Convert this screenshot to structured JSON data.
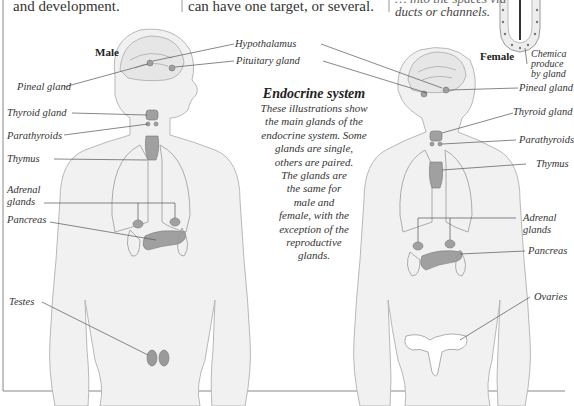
{
  "intro": {
    "col1_tail": "and development.",
    "col2_tail": "can have one target, or several.",
    "col3_tail_line1": "… into the spaces via",
    "col3_tail_line2": "ducts or channels.",
    "inset_caption": [
      "Chemica",
      "produce",
      "by gland"
    ]
  },
  "figures": {
    "male_label": "Male",
    "female_label": "Female"
  },
  "caption": {
    "title": "Endocrine system",
    "body_lines": [
      "These illustrations show",
      "the main glands of the",
      "endocrine system. Some",
      "glands are single,",
      "others are paired.",
      "The glands are",
      "the same for",
      "male and",
      "female, with the",
      "exception of the",
      "reproductive",
      "glands."
    ]
  },
  "male_labels": {
    "pineal": "Pineal gland",
    "thyroid": "Thyroid gland",
    "parathyroids": "Parathyroids",
    "thymus": "Thymus",
    "adrenal_1": "Adrenal",
    "adrenal_2": "glands",
    "pancreas": "Pancreas",
    "testes": "Testes"
  },
  "shared_labels": {
    "hypothalamus": "Hypothalamus",
    "pituitary": "Pituitary gland"
  },
  "female_labels": {
    "pineal": "Pineal gland",
    "thyroid": "Thyroid gland",
    "parathyroids": "Parathyroids",
    "thymus": "Thymus",
    "adrenal_1": "Adrenal",
    "adrenal_2": "glands",
    "pancreas": "Pancreas",
    "ovaries": "Ovaries"
  },
  "colors": {
    "body_fill": "#f1f1f1",
    "body_stroke": "#b5b5b5",
    "gland_fill": "#9a9a9a",
    "leader_line": "#555555",
    "frame_line": "#777777"
  }
}
